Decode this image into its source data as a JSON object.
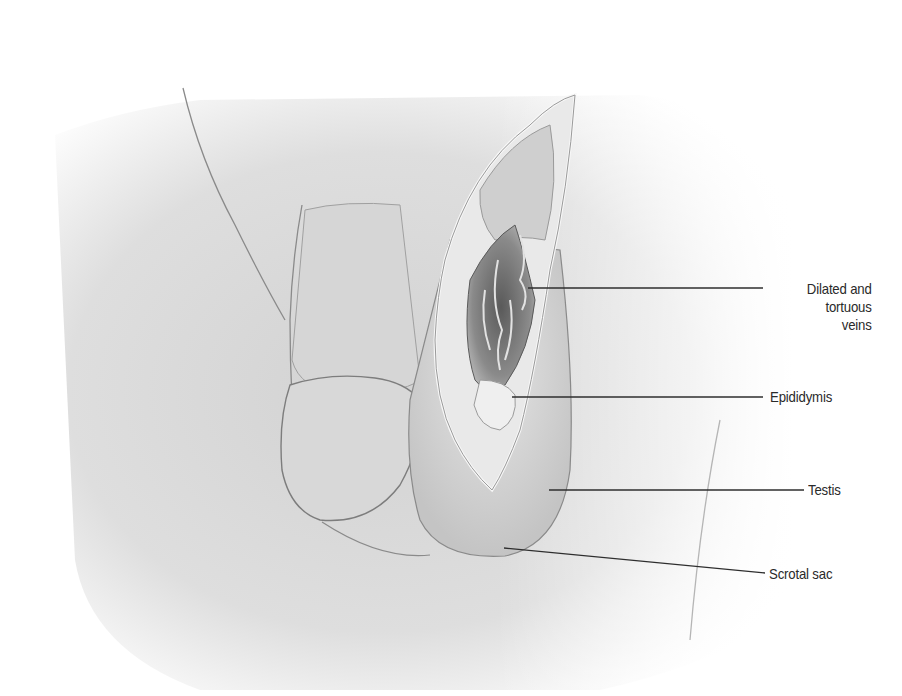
{
  "figure": {
    "colors": {
      "background": "#ffffff",
      "skin": "#d9d9d9",
      "line": "#3a3a3a",
      "text": "#2a2a2a"
    }
  },
  "labels": [
    {
      "id": "veins",
      "lines": [
        "Dilated and",
        "tortuous",
        "veins"
      ],
      "text": "Dilated and tortuous veins",
      "anchor": [
        528,
        288
      ],
      "label_point": [
        763,
        288
      ]
    },
    {
      "id": "epididymis",
      "text": "Epididymis",
      "anchor": [
        512,
        397
      ],
      "label_point": [
        763,
        397
      ]
    },
    {
      "id": "testis",
      "text": "Testis",
      "anchor": [
        549,
        490
      ],
      "label_point": [
        804,
        490
      ]
    },
    {
      "id": "scrotal-sac",
      "text": "Scrotal sac",
      "anchor": [
        504,
        548
      ],
      "label_point": [
        765,
        573
      ]
    }
  ]
}
